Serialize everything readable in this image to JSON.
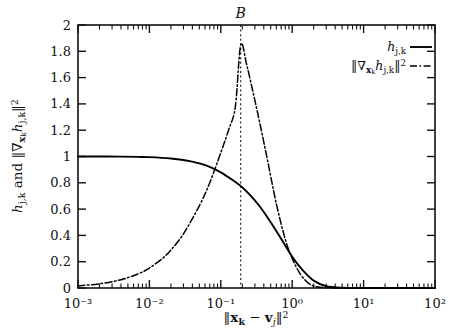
{
  "chart_data": {
    "type": "line",
    "title": "",
    "annotation_top": "B",
    "xlabel": "||x_k − v_j||²",
    "ylabel": "h_{j,k} and ||∇_{x_k} h_{j,k}||²",
    "xscale": "log",
    "yscale": "linear",
    "xlim": [
      0.001,
      100
    ],
    "ylim": [
      0,
      2
    ],
    "grid": false,
    "legend_position": "upper-right-inside",
    "xtick_labels": [
      "10⁻³",
      "10⁻²",
      "10⁻¹",
      "10⁰",
      "10¹",
      "10²"
    ],
    "xtick_values": [
      0.001,
      0.01,
      0.1,
      1,
      10,
      100
    ],
    "ytick_labels": [
      "0",
      "0.2",
      "0.4",
      "0.6",
      "0.8",
      "1",
      "1.2",
      "1.4",
      "1.6",
      "1.8",
      "2"
    ],
    "ytick_values": [
      0,
      0.2,
      0.4,
      0.6,
      0.8,
      1,
      1.2,
      1.4,
      1.6,
      1.8,
      2
    ],
    "vertical_marker": {
      "label": "B",
      "x": 0.19,
      "style": "dotted"
    },
    "series": [
      {
        "name": "h_{j,k}",
        "legend_label": "h_{j,k}",
        "style": "solid",
        "color": "#000000",
        "x": [
          0.001,
          0.002,
          0.004,
          0.007,
          0.01,
          0.02,
          0.03,
          0.05,
          0.07,
          0.1,
          0.15,
          0.19,
          0.25,
          0.35,
          0.5,
          0.7,
          1.0,
          1.4,
          2.0,
          3.0,
          5.0,
          10.0,
          30.0,
          100.0
        ],
        "y": [
          1.0,
          1.0,
          0.999,
          0.997,
          0.995,
          0.985,
          0.973,
          0.948,
          0.921,
          0.879,
          0.817,
          0.776,
          0.714,
          0.622,
          0.5,
          0.374,
          0.238,
          0.136,
          0.056,
          0.013,
          0.002,
          0.0,
          0.0,
          0.0
        ]
      },
      {
        "name": "||∇_{x_k} h_{j,k}||²",
        "legend_label": "||∇_{x_k} h_{j,k}||²",
        "style": "dash-dot",
        "color": "#000000",
        "x": [
          0.001,
          0.002,
          0.004,
          0.007,
          0.01,
          0.015,
          0.02,
          0.03,
          0.05,
          0.07,
          0.1,
          0.13,
          0.16,
          0.19,
          0.23,
          0.28,
          0.35,
          0.45,
          0.6,
          0.8,
          1.0,
          1.3,
          1.7,
          2.2,
          3.0,
          5.0,
          10.0,
          30.0,
          100.0
        ],
        "y": [
          0.016,
          0.032,
          0.063,
          0.108,
          0.152,
          0.222,
          0.288,
          0.412,
          0.625,
          0.8,
          1.03,
          1.21,
          1.38,
          1.85,
          1.7,
          1.5,
          1.26,
          0.975,
          0.64,
          0.37,
          0.225,
          0.105,
          0.035,
          0.01,
          0.002,
          0.0,
          0.0,
          0.0,
          0.0
        ]
      }
    ]
  },
  "axes": {
    "top_annotation": "B"
  }
}
